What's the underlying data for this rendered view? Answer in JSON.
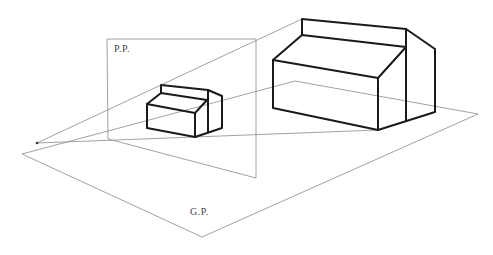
{
  "diagram": {
    "type": "perspective-projection",
    "labels": {
      "picture_plane": "P.P.",
      "ground_plane": "G.P."
    },
    "colors": {
      "construction_line": "#8a8a8a",
      "object_line": "#1a1a1a",
      "background": "#ffffff"
    }
  }
}
